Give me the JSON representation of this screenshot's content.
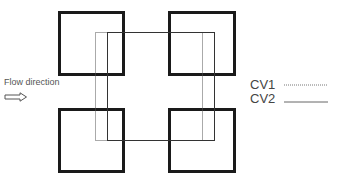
{
  "diagram": {
    "flow_label": "Flow direction",
    "legend": [
      {
        "label": "CV1",
        "style": "dotted"
      },
      {
        "label": "CV2",
        "style": "solid"
      }
    ],
    "colors": {
      "square_border": "#1a1a1a",
      "cv_line": "#555555",
      "text": "#444444"
    },
    "squares": [
      {
        "id": "top-left",
        "x": 58,
        "y": 11,
        "w": 67,
        "h": 65
      },
      {
        "id": "top-right",
        "x": 168,
        "y": 11,
        "w": 68,
        "h": 65
      },
      {
        "id": "bottom-left",
        "x": 58,
        "y": 108,
        "w": 67,
        "h": 65
      },
      {
        "id": "bottom-right",
        "x": 168,
        "y": 108,
        "w": 68,
        "h": 65
      }
    ],
    "control_volumes": {
      "CV1": {
        "x1": 95,
        "y1": 32,
        "x2": 202,
        "y2": 140
      },
      "CV2": {
        "x1": 107,
        "y1": 32,
        "x2": 214,
        "y2": 140
      }
    }
  }
}
